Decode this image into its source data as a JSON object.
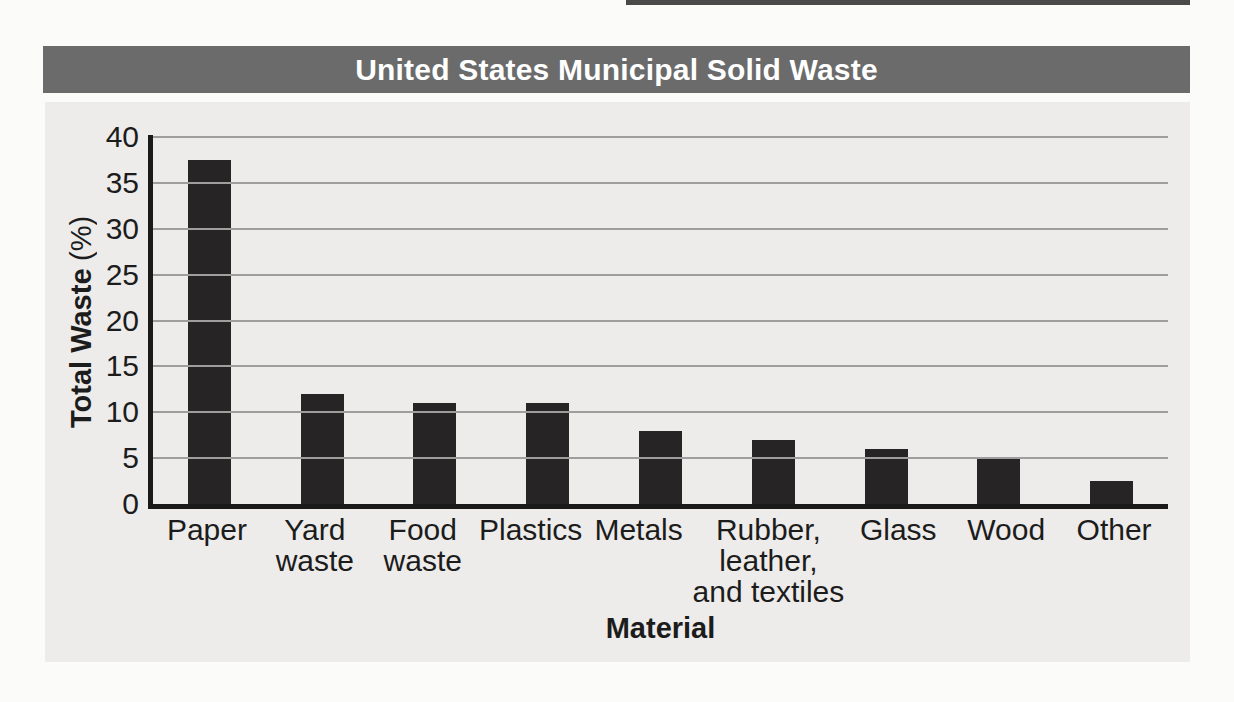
{
  "colors": {
    "page_bg": "#fbfbfa",
    "strip": "#4a4a4a",
    "title_bar_bg": "#6b6b6b",
    "title_text": "#ffffff",
    "panel_bg": "#edecea",
    "bar": "#272425",
    "gridline": "#9e9e9e",
    "axis": "#1a1a1a",
    "text": "#1c1c1c"
  },
  "chart_data": {
    "type": "bar",
    "title": "United States Municipal Solid Waste",
    "xlabel": "Material",
    "ylabel": "Total Waste (%)",
    "ylabel_main": "Total Waste",
    "ylabel_unit": "(%)",
    "categories": [
      "Paper",
      "Yard waste",
      "Food waste",
      "Plastics",
      "Metals",
      "Rubber, leather, and textiles",
      "Glass",
      "Wood",
      "Other"
    ],
    "category_lines": [
      [
        "Paper"
      ],
      [
        "Yard",
        "waste"
      ],
      [
        "Food",
        "waste"
      ],
      [
        "Plastics"
      ],
      [
        "Metals"
      ],
      [
        "Rubber,",
        "leather,",
        "and textiles"
      ],
      [
        "Glass"
      ],
      [
        "Wood"
      ],
      [
        "Other"
      ]
    ],
    "values": [
      37.5,
      12,
      11,
      11,
      8,
      7,
      6,
      5,
      2.5
    ],
    "ylim": [
      0,
      40
    ],
    "yticks": [
      0,
      5,
      10,
      15,
      20,
      25,
      30,
      35,
      40
    ],
    "grid": true,
    "legend": "none",
    "bar_color": "#272425"
  }
}
